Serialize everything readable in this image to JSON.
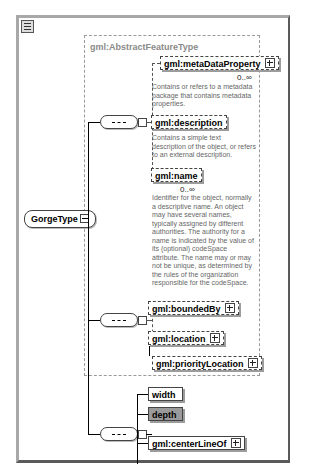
{
  "root": {
    "label": "GorgeType"
  },
  "abstract": {
    "title": "gml:AbstractFeatureType"
  },
  "elements": [
    {
      "label": "gml:metaDataProperty",
      "cardinality": "0..∞",
      "description": "Contains or refers to a metadata package that contains metadata properties."
    },
    {
      "label": "gml:description",
      "description": "Contains a simple text description of the object, or refers to an external description."
    },
    {
      "label": "gml:name",
      "cardinality": "0..∞",
      "description": "Identifier for the object, normally a descriptive name. An object may have several names, typically assigned by different authorities. The authority for a name is indicated by the value of its (optional) codeSpace attribute. The name may or may not be unique, as determined by the rules of the organization responsible for the codeSpace."
    },
    {
      "label": "gml:boundedBy"
    },
    {
      "label": "gml:location"
    },
    {
      "label": "gml:priorityLocation"
    }
  ],
  "own_elements": [
    {
      "label": "width"
    },
    {
      "label": "depth"
    },
    {
      "label": "gml:centerLineOf"
    }
  ]
}
